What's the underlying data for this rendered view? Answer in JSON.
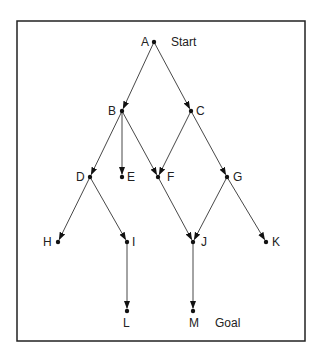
{
  "diagram": {
    "frame": {
      "x": 17,
      "y": 21,
      "w": 288,
      "h": 320
    },
    "nodes": [
      {
        "id": "A",
        "x": 154,
        "y": 42,
        "lx": -13,
        "ly": 4
      },
      {
        "id": "B",
        "x": 122,
        "y": 111,
        "lx": -14,
        "ly": 4
      },
      {
        "id": "C",
        "x": 191,
        "y": 111,
        "lx": 5,
        "ly": 4
      },
      {
        "id": "D",
        "x": 90,
        "y": 177,
        "lx": -14,
        "ly": 4
      },
      {
        "id": "E",
        "x": 122,
        "y": 177,
        "lx": 5,
        "ly": 4
      },
      {
        "id": "F",
        "x": 158,
        "y": 177,
        "lx": 9,
        "ly": 4
      },
      {
        "id": "G",
        "x": 227,
        "y": 177,
        "lx": 6,
        "ly": 4
      },
      {
        "id": "H",
        "x": 58,
        "y": 242,
        "lx": -15,
        "ly": 4
      },
      {
        "id": "I",
        "x": 127,
        "y": 242,
        "lx": 5,
        "ly": 4
      },
      {
        "id": "J",
        "x": 193,
        "y": 242,
        "lx": 8,
        "ly": 4
      },
      {
        "id": "K",
        "x": 266,
        "y": 242,
        "lx": 6,
        "ly": 4
      },
      {
        "id": "L",
        "x": 127,
        "y": 311,
        "lx": -4,
        "ly": 16
      },
      {
        "id": "M",
        "x": 193,
        "y": 311,
        "lx": -4,
        "ly": 16
      }
    ],
    "edges": [
      [
        "A",
        "B"
      ],
      [
        "A",
        "C"
      ],
      [
        "B",
        "D"
      ],
      [
        "B",
        "E"
      ],
      [
        "B",
        "F"
      ],
      [
        "C",
        "F"
      ],
      [
        "C",
        "G"
      ],
      [
        "D",
        "H"
      ],
      [
        "D",
        "I"
      ],
      [
        "F",
        "J"
      ],
      [
        "G",
        "J"
      ],
      [
        "G",
        "K"
      ],
      [
        "I",
        "L"
      ],
      [
        "J",
        "M"
      ]
    ],
    "annotations": [
      {
        "text": "Start",
        "x": 171,
        "y": 46
      },
      {
        "text": "Goal",
        "x": 215,
        "y": 327
      }
    ]
  }
}
